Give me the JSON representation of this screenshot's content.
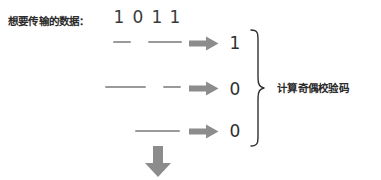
{
  "figure": {
    "title_label": "想要传输的数据：",
    "caption": "计算奇偶校验码",
    "background_color": "#ffffff",
    "dash_color": "#9a9a9a",
    "arrow_color": "#8c8c8c",
    "text_color": "#2b2b2b",
    "brace_color": "#2f2f2f"
  },
  "data_bits": [
    {
      "value": "1",
      "x": 112
    },
    {
      "value": "0",
      "x": 131
    },
    {
      "value": "1",
      "x": 150
    },
    {
      "value": "1",
      "x": 168
    }
  ],
  "parity_rows": [
    {
      "index": 1,
      "result": "1",
      "arrow": "right-arrow-icon",
      "dashes": [
        {
          "left": 113,
          "top": 41,
          "width": 18
        },
        {
          "left": 148,
          "top": 41,
          "width": 34
        }
      ],
      "arrow_pos": {
        "left": 189,
        "top": 36
      },
      "result_pos": {
        "left": 228,
        "top": 33
      }
    },
    {
      "index": 2,
      "result": "0",
      "arrow": "right-arrow-icon",
      "dashes": [
        {
          "left": 105,
          "top": 86,
          "width": 41
        },
        {
          "left": 163,
          "top": 86,
          "width": 18
        }
      ],
      "arrow_pos": {
        "left": 189,
        "top": 81
      },
      "result_pos": {
        "left": 228,
        "top": 79
      }
    },
    {
      "index": 3,
      "result": "0",
      "arrow": "right-arrow-icon",
      "dashes": [
        {
          "left": 135,
          "top": 130,
          "width": 45
        }
      ],
      "arrow_pos": {
        "left": 189,
        "top": 124
      },
      "result_pos": {
        "left": 228,
        "top": 121
      }
    }
  ],
  "down_arrow": {
    "name": "down-arrow-icon",
    "left": 144,
    "top": 146
  }
}
